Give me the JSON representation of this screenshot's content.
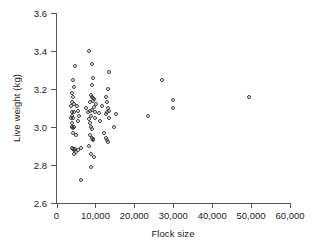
{
  "chart_data": {
    "type": "scatter",
    "title": "",
    "xlabel": "Flock size",
    "ylabel": "Live weight (kg)",
    "xlim": [
      0,
      60000
    ],
    "ylim": [
      2.6,
      3.6
    ],
    "xticks": [
      0,
      10000,
      20000,
      30000,
      40000,
      50000,
      60000
    ],
    "xtick_labels": [
      "0",
      "10,000",
      "20,000",
      "30,000",
      "40,000",
      "50,000",
      "60,000"
    ],
    "yticks": [
      2.6,
      2.8,
      3.0,
      3.2,
      3.4,
      3.6
    ],
    "ytick_labels": [
      "2.6",
      "2.8",
      "3.0",
      "3.2",
      "3.4",
      "3.6"
    ],
    "grid": false,
    "legend": null,
    "marker": "open-circle",
    "marker_color": "#3a3a3a",
    "series": [
      {
        "name": "flocks",
        "points": [
          [
            8400,
            3.4
          ],
          [
            4800,
            3.32
          ],
          [
            9200,
            3.33
          ],
          [
            4300,
            3.25
          ],
          [
            9500,
            3.26
          ],
          [
            13600,
            3.29
          ],
          [
            27000,
            3.25
          ],
          [
            4500,
            3.21
          ],
          [
            9000,
            3.22
          ],
          [
            13300,
            3.2
          ],
          [
            4100,
            3.18
          ],
          [
            4200,
            3.16
          ],
          [
            8800,
            3.17
          ],
          [
            9100,
            3.16
          ],
          [
            9400,
            3.155
          ],
          [
            9700,
            3.15
          ],
          [
            12800,
            3.16
          ],
          [
            49500,
            3.16
          ],
          [
            30000,
            3.14
          ],
          [
            4000,
            3.13
          ],
          [
            4600,
            3.12
          ],
          [
            8600,
            3.13
          ],
          [
            9300,
            3.135
          ],
          [
            10200,
            3.12
          ],
          [
            13000,
            3.13
          ],
          [
            3800,
            3.11
          ],
          [
            5200,
            3.11
          ],
          [
            7600,
            3.1
          ],
          [
            9600,
            3.105
          ],
          [
            11600,
            3.11
          ],
          [
            13200,
            3.1
          ],
          [
            30000,
            3.1
          ],
          [
            3900,
            3.08
          ],
          [
            4400,
            3.08
          ],
          [
            5600,
            3.085
          ],
          [
            8200,
            3.08
          ],
          [
            8700,
            3.085
          ],
          [
            9000,
            3.09
          ],
          [
            9900,
            3.08
          ],
          [
            10800,
            3.075
          ],
          [
            13100,
            3.08
          ],
          [
            13500,
            3.085
          ],
          [
            15300,
            3.07
          ],
          [
            4100,
            3.06
          ],
          [
            5800,
            3.06
          ],
          [
            8900,
            3.06
          ],
          [
            12600,
            3.07
          ],
          [
            23500,
            3.06
          ],
          [
            3700,
            3.05
          ],
          [
            4300,
            3.05
          ],
          [
            8300,
            3.04
          ],
          [
            9800,
            3.05
          ],
          [
            13400,
            3.05
          ],
          [
            4000,
            3.02
          ],
          [
            5400,
            3.03
          ],
          [
            8500,
            3.02
          ],
          [
            11200,
            3.03
          ],
          [
            3900,
            3.0
          ],
          [
            4100,
            3.0
          ],
          [
            4300,
            2.995
          ],
          [
            4500,
            3.0
          ],
          [
            8800,
            3.0
          ],
          [
            9200,
            2.99
          ],
          [
            14900,
            3.0
          ],
          [
            4200,
            2.97
          ],
          [
            5000,
            2.96
          ],
          [
            8600,
            2.96
          ],
          [
            12300,
            2.97
          ],
          [
            9000,
            2.94
          ],
          [
            9300,
            2.935
          ],
          [
            9500,
            2.93
          ],
          [
            12800,
            2.94
          ],
          [
            13000,
            2.93
          ],
          [
            13200,
            2.92
          ],
          [
            3900,
            2.89
          ],
          [
            4200,
            2.885
          ],
          [
            4400,
            2.88
          ],
          [
            4700,
            2.885
          ],
          [
            5000,
            2.87
          ],
          [
            5400,
            2.88
          ],
          [
            6200,
            2.89
          ],
          [
            8400,
            2.9
          ],
          [
            8900,
            2.86
          ],
          [
            4600,
            2.86
          ],
          [
            9600,
            2.84
          ],
          [
            8900,
            2.79
          ],
          [
            6300,
            2.72
          ]
        ]
      }
    ]
  }
}
